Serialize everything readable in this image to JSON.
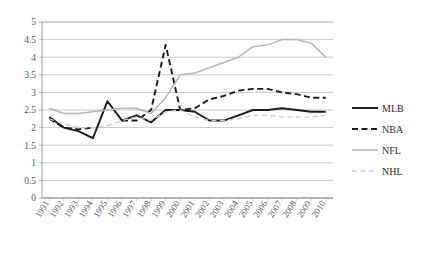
{
  "chart_data": {
    "type": "line",
    "title": "",
    "xlabel": "",
    "ylabel": "",
    "ylim": [
      0,
      5
    ],
    "ytick_step": 0.5,
    "grid": true,
    "legend_position": "right",
    "categories": [
      "1991",
      "1992",
      "1993",
      "1994",
      "1995",
      "1996",
      "1997",
      "1998",
      "1999",
      "2000",
      "2001",
      "2002",
      "2003",
      "2004",
      "2005",
      "2006",
      "2007",
      "2008",
      "2009",
      "2010"
    ],
    "yticks": [
      "0",
      "0.5",
      "1",
      "1.5",
      "2",
      "2.5",
      "3",
      "3.5",
      "4",
      "4.5",
      "5"
    ],
    "series": [
      {
        "name": "MLB",
        "color": "#1a1a1a",
        "style": "solid",
        "values": [
          2.3,
          2.0,
          1.9,
          1.7,
          2.75,
          2.2,
          2.35,
          2.15,
          2.5,
          2.5,
          2.45,
          2.2,
          2.2,
          2.35,
          2.5,
          2.5,
          2.55,
          2.5,
          2.45,
          2.45
        ]
      },
      {
        "name": "NBA",
        "color": "#1a1a1a",
        "style": "dashed",
        "values": [
          2.25,
          2.0,
          1.95,
          2.0,
          null,
          2.2,
          2.2,
          2.5,
          4.35,
          2.5,
          2.55,
          2.8,
          2.9,
          3.05,
          3.1,
          3.1,
          3.0,
          2.95,
          2.85,
          2.85
        ]
      },
      {
        "name": "NFL",
        "color": "#b5b5b5",
        "style": "solid",
        "values": [
          2.55,
          2.4,
          2.4,
          2.45,
          2.5,
          2.55,
          2.55,
          2.4,
          2.85,
          3.5,
          3.55,
          3.7,
          3.85,
          4.0,
          4.3,
          4.35,
          4.5,
          4.5,
          4.4,
          4.0
        ]
      },
      {
        "name": "NHL",
        "color": "#cccccc",
        "style": "dashed",
        "values": [
          2.25,
          2.1,
          2.0,
          2.0,
          2.05,
          2.2,
          2.3,
          2.2,
          2.45,
          2.5,
          2.3,
          2.2,
          2.2,
          2.25,
          2.35,
          2.35,
          2.3,
          2.3,
          2.3,
          2.35
        ]
      }
    ]
  },
  "legend": {
    "items": [
      {
        "label": "MLB"
      },
      {
        "label": "NBA"
      },
      {
        "label": "NFL"
      },
      {
        "label": "NHL"
      }
    ]
  },
  "top_fragment": {
    "text": "· · · ·"
  }
}
